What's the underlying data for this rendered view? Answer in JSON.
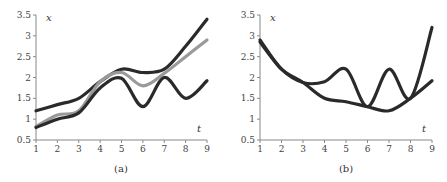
{
  "chart_data": [
    {
      "type": "line",
      "caption": "(a)",
      "xlabel": "t",
      "ylabel": "x",
      "xlim": [
        1,
        9
      ],
      "ylim": [
        0.5,
        3.5
      ],
      "xticks": [
        "1",
        "2",
        "3",
        "4",
        "5",
        "6",
        "7",
        "8",
        "9"
      ],
      "yticks": [
        "0.5",
        "1",
        "1.5",
        "2",
        "2.5",
        "3",
        "3.5"
      ],
      "grid": false,
      "legend": null,
      "series": [
        {
          "name": "upper dark",
          "color": "#2a2a2a",
          "x": [
            1,
            2,
            3,
            4,
            5,
            6,
            7,
            8,
            9
          ],
          "y": [
            1.2,
            1.35,
            1.5,
            1.9,
            2.2,
            2.12,
            2.2,
            2.75,
            3.4
          ]
        },
        {
          "name": "gray",
          "color": "#9a9a9a",
          "x": [
            1,
            2,
            3,
            4,
            5,
            6,
            7,
            8,
            9
          ],
          "y": [
            0.82,
            1.1,
            1.2,
            1.9,
            2.12,
            1.8,
            2.1,
            2.5,
            2.9
          ]
        },
        {
          "name": "lower dark",
          "color": "#2a2a2a",
          "x": [
            1,
            2,
            3,
            4,
            5,
            6,
            7,
            8,
            9
          ],
          "y": [
            0.8,
            1.0,
            1.15,
            1.75,
            1.98,
            1.3,
            2.0,
            1.5,
            1.92
          ]
        }
      ]
    },
    {
      "type": "line",
      "caption": "(b)",
      "xlabel": "t",
      "ylabel": "x",
      "xlim": [
        1,
        9
      ],
      "ylim": [
        0.5,
        3.5
      ],
      "xticks": [
        "1",
        "2",
        "3",
        "4",
        "5",
        "6",
        "7",
        "8",
        "9"
      ],
      "yticks": [
        "0.5",
        "1",
        "1.5",
        "2",
        "2.5",
        "3",
        "3.5"
      ],
      "grid": false,
      "legend": null,
      "series": [
        {
          "name": "oscillating",
          "color": "#2a2a2a",
          "x": [
            1,
            2,
            3,
            4,
            5,
            6,
            7,
            8,
            9
          ],
          "y": [
            2.9,
            2.2,
            1.88,
            1.9,
            2.2,
            1.3,
            2.2,
            1.5,
            3.2
          ]
        },
        {
          "name": "smooth",
          "color": "#2a2a2a",
          "x": [
            1,
            2,
            3,
            4,
            5,
            6,
            7,
            8,
            9
          ],
          "y": [
            2.85,
            2.2,
            1.88,
            1.5,
            1.42,
            1.3,
            1.2,
            1.5,
            1.92
          ]
        }
      ]
    }
  ]
}
